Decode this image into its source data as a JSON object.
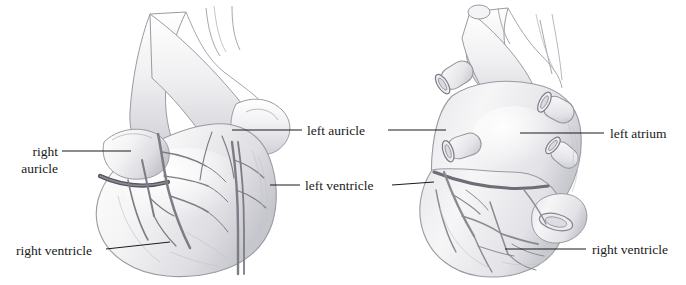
{
  "figure": {
    "type": "anatomical-illustration",
    "medium": "pencil drawing",
    "background_color": "#ffffff",
    "ink_color": "#1a1a1a",
    "tissue_color": "#f1f1f2",
    "shade_color": "#b9b9bf",
    "vessel_color": "#85858c",
    "views": [
      {
        "name": "anterior-view-heart",
        "side": "left"
      },
      {
        "name": "posterior-view-heart",
        "side": "right"
      }
    ]
  },
  "labels": {
    "right_auricle": {
      "line1": "right",
      "line2": "auricle"
    },
    "right_ventricle_left": "right ventricle",
    "left_auricle": "left auricle",
    "left_ventricle": "left ventricle",
    "left_atrium": "left atrium",
    "right_ventricle_right": "right ventricle"
  }
}
